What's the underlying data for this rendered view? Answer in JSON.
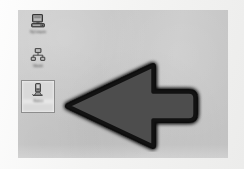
{
  "image": {
    "kind": "photographed-screenshot",
    "description": "Blurry low-resolution photo of a computer desktop with a large drawn arrow pointing left at a selected desktop icon",
    "width": 244,
    "height": 169
  },
  "colors": {
    "page_background": "#f6f6f5",
    "desktop_background": "#c8c8c8",
    "arrow_fill": "#4a4a4a",
    "arrow_outline": "#0d0d0d",
    "selection_box_fill": "#d9d9d9",
    "selection_box_border": "#8d8d8d",
    "icon_label_text": "#3a3a3a"
  },
  "desktop": {
    "name": "Desktop",
    "icons": [
      {
        "id": "my-computer",
        "glyph": "computer-icon",
        "label": "My Computer",
        "selected": false
      },
      {
        "id": "network-neighborhood",
        "glyph": "network-icon",
        "label": "Network",
        "selected": false
      },
      {
        "id": "selected-shortcut",
        "glyph": "shortcut-icon",
        "label": "Shortcut",
        "selected": true
      }
    ]
  },
  "annotation": {
    "type": "arrow",
    "direction": "left",
    "label": "arrow pointing at selected desktop icon",
    "tip": {
      "x": 50,
      "y": 96
    },
    "tail": {
      "x": 170,
      "y": 96
    },
    "head_top": {
      "x": 135,
      "y": 56
    },
    "head_bottom": {
      "x": 135,
      "y": 130
    }
  }
}
